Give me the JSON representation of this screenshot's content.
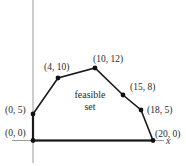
{
  "diagram": {
    "title": "",
    "region_label_line1": "feasible",
    "region_label_line2": "set",
    "x_axis_label": "x",
    "colors": {
      "axis": "#9a9a9a",
      "boundary": "#1a1a1a",
      "vertex": "#111111",
      "text": "#2a2a2a"
    },
    "vertices": [
      {
        "label": "(0, 0)",
        "x": 0,
        "y": 0
      },
      {
        "label": "(0, 5)",
        "x": 0,
        "y": 5
      },
      {
        "label": "(4, 10)",
        "x": 4,
        "y": 10
      },
      {
        "label": "(10, 12)",
        "x": 10,
        "y": 12
      },
      {
        "label": "(15, 8)",
        "x": 15,
        "y": 8
      },
      {
        "label": "(18, 5)",
        "x": 18,
        "y": 5
      },
      {
        "label": "(20, 0)",
        "x": 20,
        "y": 0
      }
    ]
  }
}
